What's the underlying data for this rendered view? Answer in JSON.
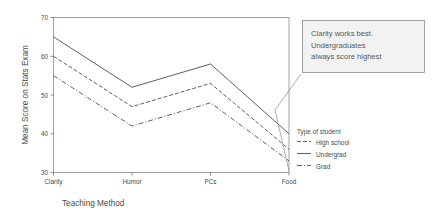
{
  "chart_data": {
    "type": "line",
    "title": "",
    "xlabel": "Teaching Method",
    "ylabel": "Mean Score on Stats Exam",
    "categories": [
      "Clarity",
      "Humor",
      "PCs",
      "Food"
    ],
    "ylim": [
      30,
      70
    ],
    "yticks": [
      30,
      40,
      50,
      60,
      70
    ],
    "ytick_labels": [
      "30",
      "40",
      "50",
      "60",
      "70"
    ],
    "grid": false,
    "legend_position": "right",
    "legend_title": "Type of student",
    "series": [
      {
        "name": "Undergrad",
        "style": "solid",
        "values": [
          65,
          52,
          58,
          40
        ]
      },
      {
        "name": "High school",
        "style": "dashed",
        "values": [
          60,
          47,
          53,
          36
        ]
      },
      {
        "name": "Grad",
        "style": "dashdot",
        "values": [
          55,
          42,
          48,
          33
        ]
      }
    ],
    "annotations": [
      {
        "id": "callout",
        "lines": [
          "Clarity works best.",
          "Undergraduates",
          "always score highest"
        ],
        "points_to": "Food"
      }
    ],
    "colors": {
      "line": "#4d4d4d",
      "frame": "#8a8a8a",
      "text": "#4a4a4a",
      "callout_fill": "#f2f2f2",
      "callout_stroke": "#8d8d8d",
      "background": "#ffffff"
    }
  },
  "axis": {
    "y_title": "Mean Score on Stats Exam",
    "x_title": "Teaching Method",
    "y_ticks": [
      "70",
      "60",
      "50",
      "40",
      "30"
    ],
    "x_ticks": [
      "Clarity",
      "Humor",
      "PCs",
      "Food"
    ]
  },
  "legend": {
    "title": "Type of student",
    "items": [
      {
        "label": "High school"
      },
      {
        "label": "Undergrad"
      },
      {
        "label": "Grad"
      }
    ]
  },
  "callout": {
    "line1": "Clarity works best.",
    "line2": "Undergraduates",
    "line3": "always score highest"
  }
}
